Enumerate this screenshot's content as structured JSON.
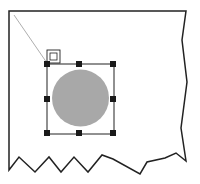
{
  "diagram": {
    "colors": {
      "background": "#ffffff",
      "page_outline": "#222222",
      "circle_fill": "#a8a8a8",
      "handle_fill": "#1a1a1a",
      "anchor_line": "#999999"
    },
    "selection": {
      "handles": 8,
      "shape": "circle"
    },
    "anchor_icon": "anchor-icon"
  }
}
